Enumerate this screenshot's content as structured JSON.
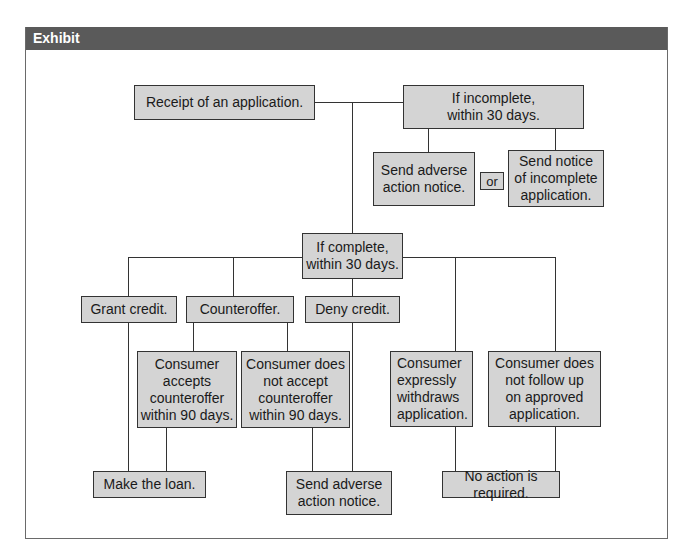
{
  "exhibit": {
    "number": "Exhibit 9.9",
    "title": "Adverse Action Flow Chart"
  },
  "nodes": {
    "receipt": "Receipt of an application.",
    "incomplete": "If incomplete,\nwithin 30 days.",
    "send_adverse_top": "Send adverse\naction notice.",
    "or": "or",
    "send_notice_incomplete": "Send notice\nof incomplete\napplication.",
    "complete": "If complete,\nwithin 30 days.",
    "grant_credit": "Grant credit.",
    "counteroffer": "Counteroffer.",
    "deny_credit": "Deny credit.",
    "consumer_accepts": "Consumer\naccepts\ncounteroffer\nwithin 90 days.",
    "consumer_not_accept": "Consumer does\nnot accept\ncounteroffer\nwithin 90 days.",
    "consumer_withdraws": "Consumer\nexpressly\nwithdraws\napplication.",
    "consumer_no_followup": "Consumer does\nnot follow up\non approved\napplication.",
    "make_loan": "Make the loan.",
    "send_adverse_bottom": "Send adverse\naction notice.",
    "no_action": "No action is required."
  },
  "colors": {
    "header_bg": "#5a5a5a",
    "box_fill": "#d4d4d4",
    "line": "#333333"
  }
}
